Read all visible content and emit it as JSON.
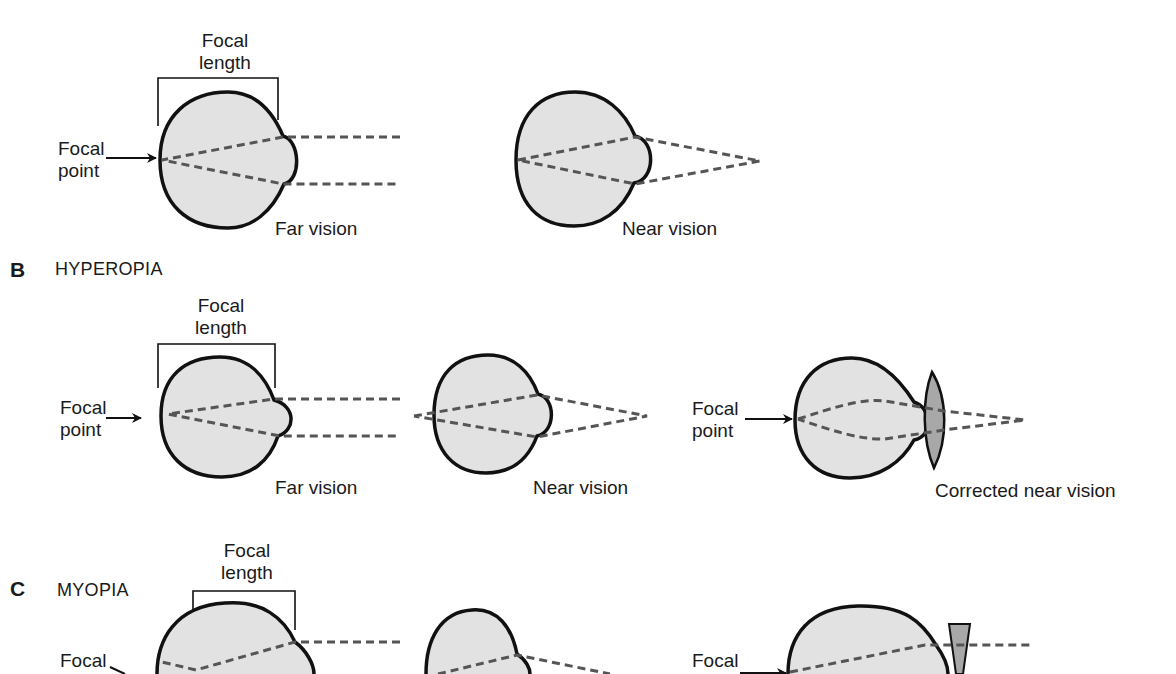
{
  "colors": {
    "eye_fill": "#e2e2e2",
    "eye_stroke": "#111111",
    "ray": "#555555",
    "lens_fill": "#a8a8a8",
    "background": "#ffffff"
  },
  "section_a": {
    "eye1": {
      "focal_length_label": [
        "Focal",
        "length"
      ],
      "focal_point_label": [
        "Focal",
        "point"
      ],
      "caption": "Far vision"
    },
    "eye2": {
      "caption": "Near vision"
    }
  },
  "section_b": {
    "letter": "B",
    "title": "HYPEROPIA",
    "eye1": {
      "focal_length_label": [
        "Focal",
        "length"
      ],
      "focal_point_label": [
        "Focal",
        "point"
      ],
      "caption": "Far vision"
    },
    "eye2": {
      "caption": "Near vision"
    },
    "eye3": {
      "focal_point_label": [
        "Focal",
        "point"
      ],
      "caption": "Corrected near vision"
    }
  },
  "section_c": {
    "letter": "C",
    "title": "MYOPIA",
    "eye1": {
      "focal_length_label": [
        "Focal",
        "length"
      ],
      "focal_point_label": [
        "Focal"
      ]
    },
    "eye3": {
      "focal_point_label": [
        "Focal"
      ]
    }
  }
}
